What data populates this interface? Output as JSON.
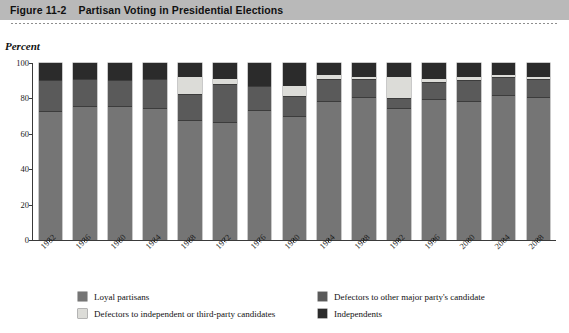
{
  "header": {
    "figure_number": "Figure 11-2",
    "title": "Partisan Voting in Presidential Elections"
  },
  "axis": {
    "ylabel": "Percent",
    "yticks": [
      "0",
      "20",
      "40",
      "60",
      "80",
      "100"
    ]
  },
  "colors": {
    "loyal": "#757575",
    "defect_major": "#5a5a5a",
    "defect_third": "#dcdcd8",
    "independents": "#2b2b2b",
    "header_bar": "#b9b9b9"
  },
  "legend": [
    {
      "label": "Loyal partisans",
      "color": "#757575",
      "key": "loyal"
    },
    {
      "label": "Defectors to other major party's candidate",
      "color": "#5a5a5a",
      "key": "defect_major"
    },
    {
      "label": "Defectors to independent or third-party candidates",
      "color": "#dcdcd8",
      "key": "defect_third"
    },
    {
      "label": "Independents",
      "color": "#2b2b2b",
      "key": "independents"
    }
  ],
  "chart_data": {
    "type": "bar",
    "subtype": "stacked-column-100",
    "title": "Partisan Voting in Presidential Elections",
    "xlabel": "",
    "ylabel": "Percent",
    "ylim": [
      0,
      100
    ],
    "yticks": [
      0,
      20,
      40,
      60,
      80,
      100
    ],
    "grid": false,
    "legend_position": "bottom",
    "categories": [
      "1952",
      "1956",
      "1960",
      "1964",
      "1968",
      "1972",
      "1976",
      "1980",
      "1984",
      "1988",
      "1992",
      "1996",
      "2000",
      "2004",
      "2008"
    ],
    "series": [
      {
        "name": "Loyal partisans",
        "color": "#757575",
        "values": [
          73,
          76,
          76,
          75,
          68,
          67,
          74,
          70,
          79,
          81,
          75,
          80,
          79,
          82,
          81
        ]
      },
      {
        "name": "Defectors to other major party's candidate",
        "color": "#5a5a5a",
        "values": [
          17,
          15,
          14,
          16,
          14,
          21,
          13,
          11,
          12,
          10,
          5,
          9,
          11,
          10,
          10
        ]
      },
      {
        "name": "Defectors to independent or third-party candidates",
        "color": "#dcdcd8",
        "values": [
          0,
          0,
          0,
          0,
          10,
          3,
          0,
          6,
          2,
          1,
          12,
          2,
          2,
          1,
          1
        ]
      },
      {
        "name": "Independents",
        "color": "#2b2b2b",
        "values": [
          10,
          9,
          10,
          9,
          8,
          9,
          13,
          13,
          7,
          8,
          8,
          9,
          8,
          7,
          8
        ]
      }
    ]
  }
}
